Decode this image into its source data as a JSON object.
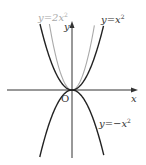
{
  "diagram": {
    "title": "",
    "axes": {
      "x_label": "x",
      "y_label": "y",
      "origin_label": "O",
      "axis_color": "#333333"
    },
    "curves": [
      {
        "name": "y-equals-x-squared",
        "label_main": "y=x",
        "label_exp": "2",
        "a": 1,
        "color": "#222222"
      },
      {
        "name": "y-equals-2x-squared",
        "label_main": "y=2x",
        "label_exp": "2",
        "a": 2,
        "color": "#a9a9a9"
      },
      {
        "name": "y-equals-neg-x-squared",
        "label_main": "y=−x",
        "label_exp": "2",
        "a": -1,
        "color": "#222222"
      }
    ]
  }
}
